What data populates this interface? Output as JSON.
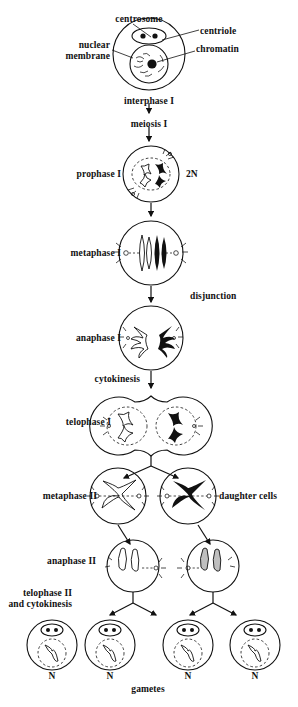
{
  "diagram": {
    "title": "meiosis",
    "callouts": [
      {
        "id": "centrosome",
        "text": "centrosome",
        "x": 139,
        "y": 14,
        "align": "c"
      },
      {
        "id": "centriole",
        "text": "centriole",
        "x": 200,
        "y": 26,
        "align": "l"
      },
      {
        "id": "nuclear-membrane",
        "text": "nuclear\nmembrane",
        "x": 110,
        "y": 46,
        "align": "r"
      },
      {
        "id": "chromatin",
        "text": "chromatin",
        "x": 196,
        "y": 49,
        "align": "l"
      }
    ],
    "stages": [
      {
        "id": "interphase-1",
        "label": "interphase I",
        "x": 149,
        "y": 96,
        "align": "c"
      },
      {
        "id": "meiosis-1",
        "label": "meiosis I",
        "x": 149,
        "y": 119,
        "align": "c"
      },
      {
        "id": "prophase-1",
        "label": "prophase I",
        "x": 121,
        "y": 174,
        "align": "r"
      },
      {
        "id": "ploidy-2n",
        "label": "2N",
        "x": 186,
        "y": 174,
        "align": "l"
      },
      {
        "id": "metaphase-1",
        "label": "metaphase I",
        "x": 121,
        "y": 251,
        "align": "r"
      },
      {
        "id": "disjunction",
        "label": "disjunction",
        "x": 190,
        "y": 296,
        "align": "l"
      },
      {
        "id": "anaphase-1",
        "label": "anaphase I",
        "x": 121,
        "y": 336,
        "align": "r"
      },
      {
        "id": "cytokinesis",
        "label": "cytokinesis",
        "x": 140,
        "y": 379,
        "align": "r"
      },
      {
        "id": "telophase-1",
        "label": "telophase I",
        "x": 111,
        "y": 421,
        "align": "r"
      },
      {
        "id": "metaphase-2",
        "label": "metaphase II",
        "x": 97,
        "y": 495,
        "align": "r"
      },
      {
        "id": "daughter-cells",
        "label": "daughter cells",
        "x": 219,
        "y": 495,
        "align": "l"
      },
      {
        "id": "anaphase-2",
        "label": "anaphase II",
        "x": 96,
        "y": 560,
        "align": "r"
      },
      {
        "id": "telophase-2",
        "label": "telophase II\nand cytokinesis",
        "x": 72,
        "y": 592,
        "align": "r"
      },
      {
        "id": "gametes",
        "label": "gametes",
        "x": 148,
        "y": 688,
        "align": "c"
      }
    ],
    "ploidy_marks": [
      {
        "id": "n-1",
        "label": "N",
        "x": 52,
        "y": 674
      },
      {
        "id": "n-2",
        "label": "N",
        "x": 110,
        "y": 674
      },
      {
        "id": "n-3",
        "label": "N",
        "x": 188,
        "y": 674
      },
      {
        "id": "n-4",
        "label": "N",
        "x": 255,
        "y": 674
      }
    ],
    "colors": {
      "ink": "#111111",
      "background": "#ffffff"
    }
  }
}
